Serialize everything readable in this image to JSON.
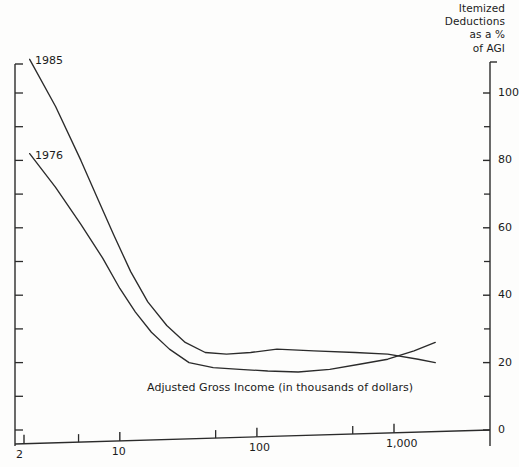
{
  "chart_data": {
    "type": "line",
    "title": "Itemized Deductions as a % of AGI",
    "title_lines": [
      "Itemized",
      "Deductions",
      "as a %",
      "of AGI"
    ],
    "xlabel": "Adjusted Gross Income (in thousands of dollars)",
    "ylabel": "Itemized Deductions as a % of AGI",
    "x_scale": "log",
    "xlim": [
      2,
      2000
    ],
    "ylim": [
      0,
      109
    ],
    "grid": false,
    "legend": "inline-labels",
    "y_axis_position": "right",
    "x_tick_labels": [
      "2",
      "10",
      "100",
      "1,000"
    ],
    "x_tick_values": [
      2,
      10,
      100,
      1000
    ],
    "x_minor_tick_values": [
      5,
      50,
      500
    ],
    "y_tick_labels": [
      "0",
      "20",
      "40",
      "60",
      "80",
      "100"
    ],
    "y_tick_values": [
      0,
      20,
      40,
      60,
      80,
      100
    ],
    "y_minor_tick_values": [
      10,
      30,
      50,
      70,
      90
    ],
    "series": [
      {
        "name": "1985",
        "label": "1985",
        "x": [
          2.2,
          3.4,
          5.2,
          7.0,
          9.0,
          12.0,
          16.0,
          22.0,
          30.0,
          42.0,
          60.0,
          90.0,
          140.0,
          260.0,
          520.0,
          900.0,
          1500.0,
          2000.0
        ],
        "y": [
          110,
          96,
          80,
          68,
          58,
          47,
          38,
          31,
          26,
          23,
          22.5,
          23,
          24,
          23.5,
          23,
          22.5,
          21,
          20
        ]
      },
      {
        "name": "1976",
        "label": "1976",
        "x": [
          2.2,
          3.4,
          5.2,
          7.5,
          10.0,
          13.0,
          17.0,
          23.0,
          32.0,
          48.0,
          75.0,
          120.0,
          200.0,
          340.0,
          560.0,
          900.0,
          1400.0,
          2000.0
        ],
        "y": [
          82,
          72,
          61,
          51,
          42,
          35,
          29,
          24,
          20,
          18.5,
          18,
          17.5,
          17.2,
          18,
          19.5,
          21,
          23.5,
          26
        ]
      }
    ],
    "annotations": [
      {
        "text": "1985",
        "x_px": 35,
        "y_px": 60
      },
      {
        "text": "1976",
        "x_px": 35,
        "y_px": 155
      }
    ]
  }
}
